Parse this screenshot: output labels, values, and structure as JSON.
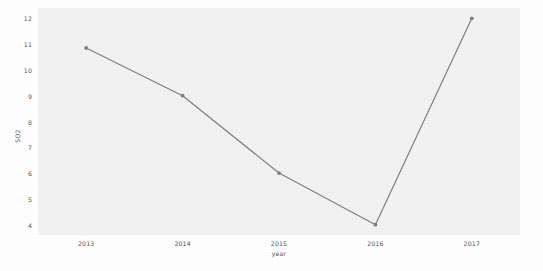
{
  "chart_data": {
    "type": "line",
    "title": "",
    "xlabel": "year",
    "ylabel": "SO2",
    "x": [
      2013,
      2014,
      2015,
      2016,
      2017
    ],
    "categories": [
      "2013",
      "2014",
      "2015",
      "2016",
      "2017"
    ],
    "values": [
      10.85,
      9.0,
      6.0,
      4.0,
      12.0
    ],
    "series": [
      {
        "name": "SO2",
        "values": [
          10.85,
          9.0,
          6.0,
          4.0,
          12.0
        ]
      }
    ],
    "xlim": [
      2012.5,
      2017.5
    ],
    "ylim": [
      3.6,
      12.4
    ],
    "yticks": [
      4,
      5,
      6,
      7,
      8,
      9,
      10,
      11,
      12
    ],
    "ytick_labels": [
      "4",
      "5",
      "6",
      "7",
      "8",
      "9",
      "10",
      "11",
      "12"
    ],
    "xticks": [
      2013,
      2014,
      2015,
      2016,
      2017
    ],
    "xtick_labels": [
      "2013",
      "2014",
      "2015",
      "2016",
      "2017"
    ],
    "grid": false,
    "legend": false,
    "legend_position": "none",
    "line_color": "#7f7f7f",
    "marker_color": "#7f7f7f",
    "marker": "circle",
    "panel_background": "#f2f2f2",
    "figure_background": "#ffffff",
    "tick_label_color": "#555555",
    "axis_title_color": "#555555"
  }
}
